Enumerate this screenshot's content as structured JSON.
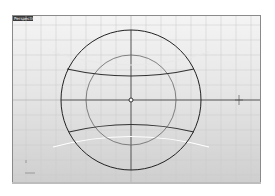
{
  "viewport": {
    "label": "Perspective",
    "active_label_bg": "#3a3a3a",
    "background_top": "#f4f4f4",
    "background_bottom": "#cfcfcf",
    "grid_color": "#c8c8c8",
    "axis_color": "#222222"
  },
  "geometry": {
    "outer_circle": {
      "cx": 118,
      "cy": 84,
      "r": 70,
      "color": "#222222"
    },
    "inner_circle": {
      "cx": 118,
      "cy": 84,
      "r": 45,
      "color": "#555555"
    },
    "origin_marker": {
      "cx": 118,
      "cy": 84,
      "r": 2
    },
    "upper_band_arc": "upper curved band edge",
    "lower_band_arc": "lower curved band edge",
    "ghost_arcs_color": "#ffffff"
  },
  "icons": {
    "cursor": "crosshair-cursor-icon",
    "world_axes": "world-axes-icon"
  }
}
